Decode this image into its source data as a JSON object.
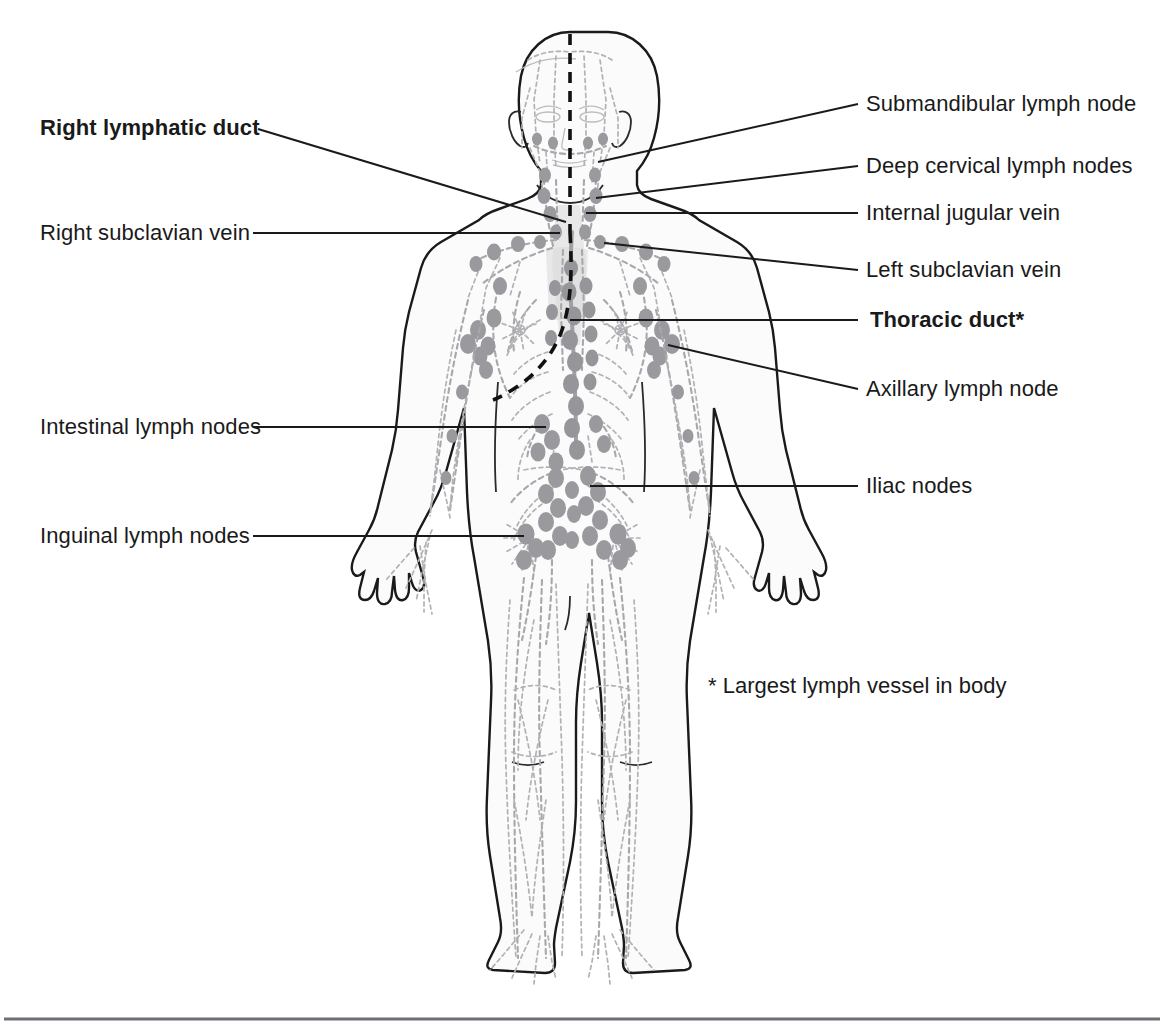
{
  "figure": {
    "footnote": "* Largest lymph vessel in body"
  },
  "labels_left": [
    {
      "id": "right-lymphatic-duct",
      "text": "Right lymphatic duct",
      "bold": true
    },
    {
      "id": "right-subclavian-vein",
      "text": "Right subclavian vein",
      "bold": false
    },
    {
      "id": "intestinal-lymph-nodes",
      "text": "Intestinal lymph nodes",
      "bold": false
    },
    {
      "id": "inguinal-lymph-nodes",
      "text": "Inguinal lymph nodes",
      "bold": false
    }
  ],
  "labels_right": [
    {
      "id": "submandibular-lymph-node",
      "text": "Submandibular lymph node",
      "bold": false
    },
    {
      "id": "deep-cervical-lymph-nodes",
      "text": "Deep cervical lymph nodes",
      "bold": false
    },
    {
      "id": "internal-jugular-vein",
      "text": "Internal jugular vein",
      "bold": false
    },
    {
      "id": "left-subclavian-vein",
      "text": "Left subclavian vein",
      "bold": false
    },
    {
      "id": "thoracic-duct",
      "text": "Thoracic duct*",
      "bold": true
    },
    {
      "id": "axillary-lymph-node",
      "text": "Axillary lymph node",
      "bold": false
    },
    {
      "id": "iliac-nodes",
      "text": "Iliac nodes",
      "bold": false
    }
  ],
  "colors": {
    "text": "#1a1a1a",
    "leader": "#1a1a1a",
    "body_outline": "#1a1a1a",
    "lymph_node": "#9a9a9e",
    "lymph_vessel": "#a8a8ac",
    "midline_dash": "#111111",
    "rule": "#6f6f77",
    "background": "#ffffff"
  }
}
